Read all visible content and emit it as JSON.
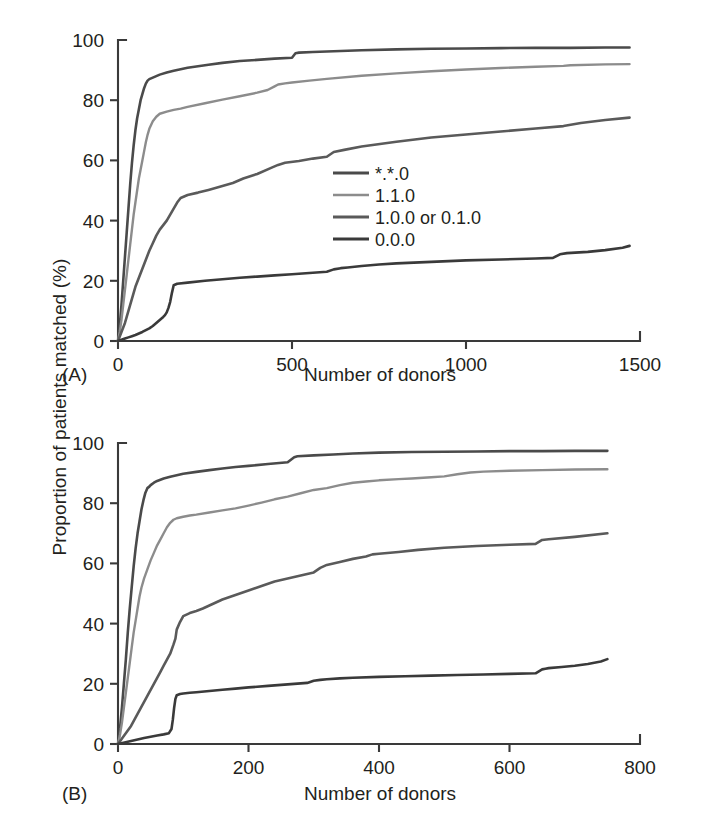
{
  "figure": {
    "shared_ylabel": "Proportion of patients matched (%)",
    "background_color": "#ffffff",
    "text_color": "#231f20"
  },
  "panel_a": {
    "tag": "(A)",
    "xlabel": "Number of donors"
  },
  "panel_b": {
    "tag": "(B)",
    "xlabel": "Number of donors"
  },
  "legend": {
    "position": "center-right of panel A",
    "items": [
      {
        "label": "*.*.0",
        "color": "#4a4a4a"
      },
      {
        "label": "1.1.0",
        "color": "#8c8c8c"
      },
      {
        "label": "1.0.0 or 0.1.0",
        "color": "#5a5a5a"
      },
      {
        "label": "0.0.0",
        "color": "#3a3a3a"
      }
    ]
  },
  "chart_data": [
    {
      "type": "line",
      "panel": "A",
      "title": "",
      "xlabel": "Number of donors",
      "ylabel": "Proportion of patients matched (%)",
      "xlim": [
        0,
        1500
      ],
      "ylim": [
        0,
        100
      ],
      "xticks": [
        0,
        500,
        1000,
        1500
      ],
      "yticks": [
        0,
        20,
        40,
        60,
        80,
        100
      ],
      "grid": false,
      "legend_position": "center-right",
      "series": [
        {
          "name": "*.*.0",
          "color": "#4a4a4a",
          "x": [
            0,
            5,
            10,
            15,
            20,
            25,
            30,
            35,
            40,
            45,
            50,
            55,
            60,
            65,
            70,
            75,
            80,
            85,
            90,
            100,
            110,
            120,
            140,
            160,
            180,
            200,
            230,
            260,
            300,
            350,
            400,
            450,
            500,
            510,
            520,
            560,
            600,
            700,
            800,
            900,
            1000,
            1100,
            1200,
            1300,
            1400,
            1470
          ],
          "y": [
            0,
            5,
            12,
            20,
            28,
            36,
            44,
            52,
            59,
            65,
            70,
            74,
            77,
            80,
            82,
            84,
            85.5,
            86.5,
            87,
            87.5,
            88,
            88.5,
            89.2,
            89.8,
            90.3,
            90.8,
            91.3,
            91.8,
            92.4,
            93.0,
            93.4,
            93.8,
            94.1,
            95.6,
            95.8,
            96.0,
            96.2,
            96.6,
            96.9,
            97.1,
            97.2,
            97.3,
            97.4,
            97.4,
            97.5,
            97.5
          ]
        },
        {
          "name": "1.1.0",
          "color": "#8c8c8c",
          "x": [
            0,
            5,
            10,
            15,
            20,
            25,
            30,
            35,
            40,
            45,
            50,
            55,
            60,
            65,
            70,
            75,
            80,
            85,
            90,
            100,
            110,
            120,
            140,
            160,
            180,
            200,
            250,
            300,
            350,
            400,
            430,
            450,
            460,
            480,
            500,
            550,
            600,
            700,
            800,
            900,
            1000,
            1100,
            1200,
            1280,
            1300,
            1400,
            1470
          ],
          "y": [
            0,
            3,
            7,
            12,
            17,
            22,
            27,
            32,
            37,
            42,
            46,
            50,
            54,
            57,
            60,
            63,
            66,
            68.5,
            70.5,
            73,
            74.5,
            75.5,
            76.2,
            76.8,
            77.2,
            77.8,
            79.0,
            80.2,
            81.3,
            82.5,
            83.4,
            84.6,
            85.2,
            85.6,
            85.9,
            86.5,
            87.1,
            88.1,
            88.9,
            89.6,
            90.2,
            90.7,
            91.1,
            91.4,
            91.6,
            91.9,
            92.0
          ]
        },
        {
          "name": "1.0.0 or 0.1.0",
          "color": "#5a5a5a",
          "x": [
            0,
            5,
            10,
            15,
            20,
            25,
            30,
            35,
            40,
            45,
            50,
            60,
            70,
            80,
            90,
            100,
            110,
            120,
            130,
            140,
            150,
            160,
            170,
            180,
            200,
            230,
            260,
            300,
            330,
            360,
            400,
            440,
            460,
            480,
            520,
            560,
            600,
            620,
            650,
            700,
            800,
            900,
            1000,
            1100,
            1200,
            1280,
            1330,
            1400,
            1470
          ],
          "y": [
            0,
            1.5,
            3,
            4.5,
            6,
            8,
            10,
            12,
            14,
            16,
            18,
            21,
            24,
            27,
            30,
            32.5,
            35,
            37,
            38.5,
            40,
            42,
            44,
            46,
            47.5,
            48.5,
            49.3,
            50.2,
            51.5,
            52.5,
            54.0,
            55.5,
            57.5,
            58.5,
            59.2,
            59.8,
            60.6,
            61.2,
            62.8,
            63.5,
            64.6,
            66.2,
            67.6,
            68.6,
            69.6,
            70.6,
            71.4,
            72.4,
            73.4,
            74.2
          ]
        },
        {
          "name": "0.0.0",
          "color": "#3a3a3a",
          "x": [
            0,
            10,
            20,
            30,
            40,
            50,
            60,
            70,
            80,
            90,
            100,
            110,
            120,
            130,
            135,
            140,
            145,
            150,
            155,
            160,
            170,
            200,
            250,
            300,
            350,
            400,
            450,
            500,
            550,
            600,
            620,
            640,
            660,
            700,
            750,
            800,
            900,
            1000,
            1100,
            1200,
            1250,
            1270,
            1290,
            1350,
            1400,
            1450,
            1470
          ],
          "y": [
            0,
            0.4,
            0.8,
            1.2,
            1.6,
            2.0,
            2.5,
            3.0,
            3.6,
            4.2,
            5.0,
            6.0,
            7.0,
            8.0,
            8.6,
            9.5,
            11.0,
            13.0,
            16.0,
            18.5,
            19.0,
            19.4,
            20.0,
            20.5,
            21.0,
            21.4,
            21.8,
            22.2,
            22.6,
            23.0,
            23.8,
            24.2,
            24.4,
            24.9,
            25.4,
            25.8,
            26.3,
            26.8,
            27.1,
            27.4,
            27.6,
            28.8,
            29.2,
            29.6,
            30.2,
            31.0,
            31.6
          ]
        }
      ]
    },
    {
      "type": "line",
      "panel": "B",
      "title": "",
      "xlabel": "Number of donors",
      "ylabel": "Proportion of patients matched (%)",
      "xlim": [
        0,
        800
      ],
      "ylim": [
        0,
        100
      ],
      "xticks": [
        0,
        200,
        400,
        600,
        800
      ],
      "yticks": [
        0,
        20,
        40,
        60,
        80,
        100
      ],
      "grid": false,
      "series": [
        {
          "name": "*.*.0",
          "color": "#4a4a4a",
          "x": [
            0,
            3,
            6,
            9,
            12,
            15,
            18,
            21,
            24,
            27,
            30,
            33,
            36,
            39,
            42,
            45,
            48,
            50,
            55,
            60,
            70,
            80,
            90,
            100,
            120,
            140,
            160,
            180,
            200,
            230,
            260,
            270,
            275,
            300,
            330,
            360,
            400,
            450,
            500,
            550,
            600,
            650,
            700,
            750
          ],
          "y": [
            0,
            5,
            12,
            20,
            28,
            37,
            45,
            52,
            59,
            65,
            70,
            74,
            78,
            81,
            83.5,
            85,
            85.5,
            86,
            86.8,
            87.4,
            88.2,
            88.8,
            89.3,
            89.8,
            90.4,
            91.0,
            91.5,
            92.0,
            92.4,
            93.0,
            93.6,
            95.3,
            95.6,
            95.9,
            96.2,
            96.5,
            96.8,
            97.0,
            97.1,
            97.2,
            97.3,
            97.3,
            97.4,
            97.4
          ]
        },
        {
          "name": "1.1.0",
          "color": "#8c8c8c",
          "x": [
            0,
            3,
            6,
            9,
            12,
            15,
            18,
            21,
            24,
            27,
            30,
            33,
            36,
            40,
            45,
            50,
            55,
            60,
            65,
            70,
            75,
            80,
            85,
            90,
            100,
            110,
            120,
            140,
            160,
            180,
            200,
            220,
            240,
            260,
            280,
            300,
            320,
            340,
            360,
            380,
            400,
            430,
            450,
            480,
            500,
            520,
            540,
            560,
            600,
            650,
            700,
            750
          ],
          "y": [
            0,
            3,
            7,
            12,
            17,
            22,
            27,
            32,
            37,
            41,
            45,
            49,
            52,
            55,
            58,
            61,
            63.5,
            66,
            68,
            70,
            72,
            73.5,
            74.5,
            75,
            75.5,
            75.9,
            76.2,
            76.9,
            77.6,
            78.3,
            79.2,
            80.2,
            81.3,
            82.2,
            83.3,
            84.4,
            85.0,
            86.0,
            86.8,
            87.2,
            87.6,
            88.0,
            88.2,
            88.6,
            88.9,
            89.6,
            90.2,
            90.5,
            90.8,
            91.0,
            91.2,
            91.3
          ]
        },
        {
          "name": "1.0.0 or 0.1.0",
          "color": "#5a5a5a",
          "x": [
            0,
            5,
            10,
            15,
            20,
            25,
            30,
            35,
            40,
            45,
            50,
            55,
            60,
            65,
            70,
            75,
            80,
            85,
            88,
            90,
            95,
            100,
            110,
            120,
            130,
            140,
            150,
            160,
            180,
            200,
            220,
            240,
            260,
            280,
            300,
            310,
            320,
            340,
            360,
            380,
            390,
            400,
            430,
            460,
            500,
            550,
            600,
            640,
            650,
            660,
            700,
            750
          ],
          "y": [
            0,
            1.5,
            3,
            4.5,
            6,
            8,
            10,
            12,
            14,
            16,
            18,
            20,
            22,
            24,
            26,
            28,
            30,
            33,
            35,
            38,
            40.5,
            42.5,
            43.5,
            44.2,
            45,
            46,
            47,
            48,
            49.5,
            51,
            52.5,
            54,
            55,
            56,
            57,
            58.5,
            59.5,
            60.5,
            61.5,
            62.3,
            63.0,
            63.2,
            63.8,
            64.5,
            65.2,
            65.8,
            66.2,
            66.5,
            67.8,
            68.0,
            68.8,
            70.0
          ]
        },
        {
          "name": "0.0.0",
          "color": "#3a3a3a",
          "x": [
            0,
            10,
            20,
            30,
            40,
            50,
            60,
            70,
            78,
            82,
            84,
            86,
            88,
            90,
            95,
            100,
            110,
            120,
            140,
            160,
            180,
            200,
            230,
            260,
            290,
            300,
            310,
            320,
            340,
            360,
            400,
            440,
            480,
            520,
            560,
            600,
            640,
            650,
            655,
            660,
            680,
            700,
            720,
            740,
            750
          ],
          "y": [
            0,
            0.5,
            1.0,
            1.5,
            2.0,
            2.4,
            2.8,
            3.2,
            3.6,
            5.0,
            8.0,
            12.0,
            15.0,
            16.2,
            16.6,
            16.8,
            17.0,
            17.2,
            17.6,
            18.0,
            18.4,
            18.8,
            19.3,
            19.8,
            20.3,
            21.0,
            21.3,
            21.5,
            21.8,
            22.0,
            22.3,
            22.5,
            22.7,
            22.9,
            23.1,
            23.3,
            23.5,
            24.8,
            25.0,
            25.2,
            25.6,
            26.0,
            26.6,
            27.4,
            28.2
          ]
        }
      ]
    }
  ]
}
